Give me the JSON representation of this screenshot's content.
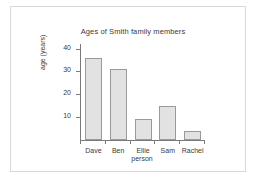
{
  "chart_data": {
    "type": "bar",
    "title": "Ages of Smith family members",
    "xlabel": "person",
    "ylabel": "age (years)",
    "categories": [
      "Dave",
      "Ben",
      "Ellie",
      "Sam",
      "Rachel"
    ],
    "values": [
      36,
      31,
      9,
      15,
      4
    ],
    "yticks": [
      10,
      20,
      30,
      40
    ],
    "ytick_labels": [
      "10",
      "20",
      "30",
      "40"
    ],
    "ylim": [
      0,
      42
    ],
    "grid": false,
    "legend": null,
    "bar_fill_color": "#e2e2e2",
    "bar_border_color": "#9a9a9a",
    "axis_color": "#7a7a7a",
    "text_color": "#3a3a3a",
    "background_color": "#ffffff"
  }
}
